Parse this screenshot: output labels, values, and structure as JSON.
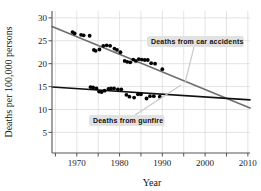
{
  "chart_data": {
    "type": "scatter",
    "title": "",
    "xlabel": "Year",
    "ylabel": "Deaths per 100,000 persons",
    "xlim": [
      1964.2,
      2010.5
    ],
    "ylim": [
      0.5,
      31.5
    ],
    "xticks": [
      1970,
      1980,
      1990,
      2000,
      2010
    ],
    "xtick_labels": [
      "1970",
      "1980",
      "1990",
      "2000",
      "2010"
    ],
    "xminor_ticks": [
      1965,
      1975,
      1985,
      1995,
      2005
    ],
    "yticks": [
      5,
      10,
      15,
      20,
      25,
      30
    ],
    "ytick_labels": [
      "5",
      "10",
      "15",
      "20",
      "25",
      "30"
    ],
    "grid": true,
    "grid_color": "#d8d8d8",
    "legend_position": "annotations-inline",
    "series": [
      {
        "name": "Deaths from car accidents",
        "marker_color": "#000000",
        "line_color": "#6e6e6e",
        "trendline": {
          "x": [
            1964.2,
            2010.5
          ],
          "y": [
            28.1,
            10.3
          ]
        },
        "points": [
          {
            "x": 1969.0,
            "y": 26.9
          },
          {
            "x": 1969.5,
            "y": 26.6
          },
          {
            "x": 1971.0,
            "y": 26.3
          },
          {
            "x": 1971.6,
            "y": 26.2
          },
          {
            "x": 1973.0,
            "y": 26.1
          },
          {
            "x": 1974.0,
            "y": 23.0
          },
          {
            "x": 1974.4,
            "y": 22.8
          },
          {
            "x": 1975.3,
            "y": 23.1
          },
          {
            "x": 1976.2,
            "y": 23.9
          },
          {
            "x": 1977.0,
            "y": 24.0
          },
          {
            "x": 1977.8,
            "y": 23.9
          },
          {
            "x": 1978.8,
            "y": 23.3
          },
          {
            "x": 1979.4,
            "y": 23.0
          },
          {
            "x": 1980.2,
            "y": 22.5
          },
          {
            "x": 1981.2,
            "y": 20.6
          },
          {
            "x": 1981.8,
            "y": 20.4
          },
          {
            "x": 1982.5,
            "y": 20.3
          },
          {
            "x": 1983.2,
            "y": 20.9
          },
          {
            "x": 1983.8,
            "y": 20.6
          },
          {
            "x": 1984.5,
            "y": 21.0
          },
          {
            "x": 1985.2,
            "y": 20.9
          },
          {
            "x": 1985.9,
            "y": 20.8
          },
          {
            "x": 1986.6,
            "y": 20.8
          },
          {
            "x": 1987.4,
            "y": 20.1
          },
          {
            "x": 1988.3,
            "y": 20.0
          },
          {
            "x": 1990.0,
            "y": 18.8
          }
        ]
      },
      {
        "name": "Deaths from gunfire",
        "marker_color": "#000000",
        "line_color": "#111111",
        "trendline": {
          "x": [
            1964.2,
            2010.5
          ],
          "y": [
            14.9,
            12.1
          ]
        },
        "points": [
          {
            "x": 1973.2,
            "y": 14.9
          },
          {
            "x": 1973.8,
            "y": 14.8
          },
          {
            "x": 1974.6,
            "y": 14.6
          },
          {
            "x": 1975.2,
            "y": 13.9
          },
          {
            "x": 1975.8,
            "y": 13.8
          },
          {
            "x": 1976.5,
            "y": 14.1
          },
          {
            "x": 1977.4,
            "y": 14.5
          },
          {
            "x": 1978.0,
            "y": 14.6
          },
          {
            "x": 1978.7,
            "y": 14.6
          },
          {
            "x": 1979.6,
            "y": 14.4
          },
          {
            "x": 1980.4,
            "y": 14.4
          },
          {
            "x": 1981.6,
            "y": 13.2
          },
          {
            "x": 1982.3,
            "y": 12.8
          },
          {
            "x": 1983.4,
            "y": 12.6
          },
          {
            "x": 1984.3,
            "y": 13.3
          },
          {
            "x": 1985.0,
            "y": 13.3
          },
          {
            "x": 1986.3,
            "y": 12.4
          },
          {
            "x": 1987.1,
            "y": 12.9
          },
          {
            "x": 1988.0,
            "y": 12.9
          },
          {
            "x": 1989.4,
            "y": 12.8
          }
        ]
      }
    ],
    "annotations": [
      {
        "id": "car-accidents",
        "label": "Deaths from car accidents",
        "box_x": 147,
        "box_y": 36,
        "leader_to_x": 185,
        "leader_to_y": 83
      },
      {
        "id": "gunfire",
        "label": "Deaths from gunfire",
        "box_x": 89,
        "box_y": 115,
        "leader_to_x": 181,
        "leader_to_y": 85
      }
    ]
  }
}
